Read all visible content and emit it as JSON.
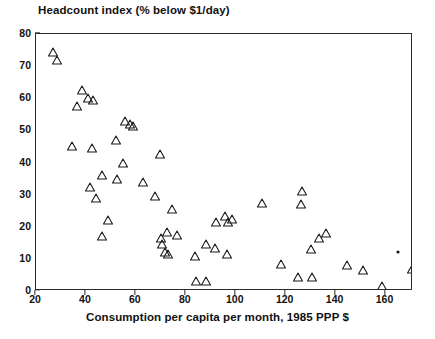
{
  "chart_data": {
    "type": "scatter",
    "title": "Headcount index (% below $1/day)",
    "xlabel": "Consumption per capita per month, 1985 PPP $",
    "ylabel": "Headcount index (% below $1/day)",
    "xlim": [
      20,
      171
    ],
    "ylim": [
      0,
      80
    ],
    "xticks": [
      20,
      40,
      60,
      80,
      100,
      120,
      140,
      160
    ],
    "yticks": [
      0,
      10,
      20,
      30,
      40,
      50,
      60,
      70,
      80
    ],
    "grid": false,
    "legend": "none",
    "marker": "open-triangle",
    "marker_color": "#1a1a1a",
    "series": [
      {
        "name": "countries",
        "marker": "triangle",
        "points": [
          [
            27.0,
            74.5
          ],
          [
            28.5,
            72.0
          ],
          [
            38.5,
            62.5
          ],
          [
            41.0,
            60.0
          ],
          [
            43.0,
            59.5
          ],
          [
            36.5,
            57.5
          ],
          [
            55.5,
            53.0
          ],
          [
            57.5,
            52.0
          ],
          [
            59.0,
            51.5
          ],
          [
            52.0,
            47.0
          ],
          [
            34.5,
            45.0
          ],
          [
            42.5,
            44.5
          ],
          [
            69.5,
            42.5
          ],
          [
            55.0,
            40.0
          ],
          [
            46.5,
            36.0
          ],
          [
            52.5,
            35.0
          ],
          [
            63.0,
            34.0
          ],
          [
            41.5,
            32.5
          ],
          [
            44.0,
            29.0
          ],
          [
            110.5,
            27.5
          ],
          [
            126.5,
            31.0
          ],
          [
            67.5,
            29.5
          ],
          [
            74.5,
            25.5
          ],
          [
            95.5,
            23.5
          ],
          [
            98.5,
            22.5
          ],
          [
            49.0,
            22.0
          ],
          [
            92.0,
            21.5
          ],
          [
            97.0,
            21.5
          ],
          [
            126.0,
            27.0
          ],
          [
            72.5,
            18.5
          ],
          [
            76.5,
            17.5
          ],
          [
            46.5,
            17.0
          ],
          [
            70.0,
            16.5
          ],
          [
            70.5,
            14.5
          ],
          [
            88.0,
            14.5
          ],
          [
            91.5,
            13.5
          ],
          [
            96.5,
            11.5
          ],
          [
            130.0,
            13.0
          ],
          [
            136.0,
            18.0
          ],
          [
            133.5,
            16.5
          ],
          [
            71.5,
            12.0
          ],
          [
            73.0,
            11.5
          ],
          [
            83.5,
            11.0
          ],
          [
            118.0,
            8.5
          ],
          [
            144.5,
            8.0
          ],
          [
            151.0,
            6.5
          ],
          [
            125.0,
            4.5
          ],
          [
            130.5,
            4.5
          ],
          [
            84.0,
            3.0
          ],
          [
            88.0,
            3.0
          ],
          [
            158.5,
            1.5
          ],
          [
            170.5,
            7.0
          ]
        ]
      },
      {
        "name": "outlier-dot",
        "marker": "dot",
        "points": [
          [
            165.0,
            12.0
          ]
        ]
      }
    ]
  },
  "axes": {
    "x_tick_labels": [
      "20",
      "40",
      "60",
      "80",
      "100",
      "120",
      "140",
      "160"
    ],
    "y_tick_labels": [
      "0",
      "10",
      "20",
      "30",
      "40",
      "50",
      "60",
      "70",
      "80"
    ]
  }
}
